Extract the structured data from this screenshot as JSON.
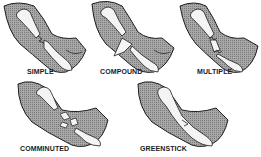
{
  "colors": {
    "skin": "#9a9a9a",
    "bone": "#f4f4f4",
    "outline": "#1e1e1e",
    "background": "#ffffff"
  },
  "panels": [
    {
      "id": "simple",
      "label": "SIMPLE"
    },
    {
      "id": "compound",
      "label": "COMPOUND"
    },
    {
      "id": "multiple",
      "label": "MULTIPLE"
    },
    {
      "id": "comminuted",
      "label": "COMMINUTED"
    },
    {
      "id": "greenstick",
      "label": "GREENSTICK"
    }
  ]
}
